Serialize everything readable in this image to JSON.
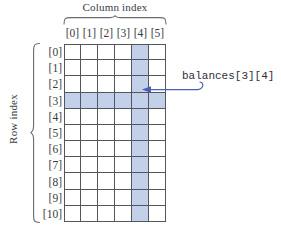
{
  "diagram": {
    "column_axis": {
      "caption": "Column index",
      "headers": [
        "[0]",
        "[1]",
        "[2]",
        "[3]",
        "[4]",
        "[5]"
      ]
    },
    "row_axis": {
      "caption": "Row index",
      "headers": [
        "[0]",
        "[1]",
        "[2]",
        "[3]",
        "[4]",
        "[5]",
        "[6]",
        "[7]",
        "[8]",
        "[9]",
        "[10]"
      ]
    },
    "grid": {
      "rows": 11,
      "columns": 6,
      "highlight_row_index": 3,
      "highlight_column_index": 4,
      "cell_values": [
        [
          "",
          "",
          "",
          "",
          "",
          ""
        ],
        [
          "",
          "",
          "",
          "",
          "",
          ""
        ],
        [
          "",
          "",
          "",
          "",
          "",
          ""
        ],
        [
          "",
          "",
          "",
          "",
          "",
          ""
        ],
        [
          "",
          "",
          "",
          "",
          "",
          ""
        ],
        [
          "",
          "",
          "",
          "",
          "",
          ""
        ],
        [
          "",
          "",
          "",
          "",
          "",
          ""
        ],
        [
          "",
          "",
          "",
          "",
          "",
          ""
        ],
        [
          "",
          "",
          "",
          "",
          "",
          ""
        ],
        [
          "",
          "",
          "",
          "",
          "",
          ""
        ],
        [
          "",
          "",
          "",
          "",
          "",
          ""
        ]
      ]
    },
    "annotation": {
      "label": "balances[3][4]",
      "points_to_row": 3,
      "points_to_column": 4
    },
    "colors": {
      "highlight": "#c2d0ea",
      "grid_line": "#55555e",
      "arrow": "#4a61b4",
      "text": "#3a3a42",
      "background": "#ffffff"
    }
  }
}
